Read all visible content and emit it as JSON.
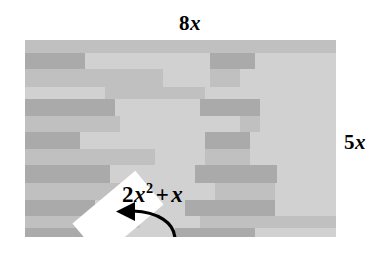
{
  "figure": {
    "type": "geometry-diagram",
    "top_label": "8x",
    "top_label_coefficient": "8",
    "top_label_variable": "x",
    "right_label": "5x",
    "right_label_coefficient": "5",
    "right_label_variable": "x",
    "region_label": {
      "coefficient": "2",
      "variable": "x",
      "exponent": "2",
      "operator": "+",
      "second_term": "x",
      "full_text": "2x² + x"
    },
    "arrow": {
      "name": "curved-arrow",
      "direction": "left",
      "points_to": "white-rotated-rectangle"
    },
    "colors": {
      "background": "#ffffff",
      "fill_light": "#cfcfcf",
      "fill_mid": "#bdbdbd",
      "fill_dark": "#a6a6a6",
      "fill_darker": "#9b9b9b",
      "cutout": "#ffffff",
      "ink": "#000000"
    },
    "rect_bounds": {
      "x": 25,
      "y": 40,
      "width": 311,
      "height": 197
    },
    "cut_piece": {
      "x": 52,
      "y": 152,
      "width": 82,
      "height": 44,
      "rotation_deg": -40
    },
    "brick_rows": [
      {
        "y": 0,
        "h": 13,
        "tone": "fill_mid",
        "blocks": []
      },
      {
        "y": 13,
        "h": 16,
        "tone": "fill_light",
        "blocks": [
          {
            "x": 0,
            "w": 60,
            "tone": "fill_dark"
          },
          {
            "x": 185,
            "w": 45,
            "tone": "fill_dark"
          }
        ]
      },
      {
        "y": 29,
        "h": 18,
        "tone": "fill_mid",
        "blocks": [
          {
            "x": 138,
            "w": 47,
            "tone": "fill_light"
          },
          {
            "x": 215,
            "w": 96,
            "tone": "fill_light"
          }
        ]
      },
      {
        "y": 47,
        "h": 12,
        "tone": "fill_light",
        "blocks": [
          {
            "x": 80,
            "w": 100,
            "tone": "fill_mid"
          }
        ]
      },
      {
        "y": 59,
        "h": 17,
        "tone": "fill_light",
        "blocks": [
          {
            "x": 0,
            "w": 90,
            "tone": "fill_dark"
          },
          {
            "x": 175,
            "w": 60,
            "tone": "fill_dark"
          }
        ]
      },
      {
        "y": 76,
        "h": 16,
        "tone": "fill_mid",
        "blocks": [
          {
            "x": 95,
            "w": 120,
            "tone": "fill_light"
          },
          {
            "x": 235,
            "w": 76,
            "tone": "fill_light"
          }
        ]
      },
      {
        "y": 92,
        "h": 17,
        "tone": "fill_light",
        "blocks": [
          {
            "x": 0,
            "w": 55,
            "tone": "fill_dark"
          },
          {
            "x": 180,
            "w": 45,
            "tone": "fill_dark"
          }
        ]
      },
      {
        "y": 109,
        "h": 16,
        "tone": "fill_mid",
        "blocks": [
          {
            "x": 130,
            "w": 50,
            "tone": "fill_light"
          },
          {
            "x": 225,
            "w": 86,
            "tone": "fill_light"
          }
        ]
      },
      {
        "y": 125,
        "h": 18,
        "tone": "fill_light",
        "blocks": [
          {
            "x": 0,
            "w": 85,
            "tone": "fill_dark"
          },
          {
            "x": 170,
            "w": 82,
            "tone": "fill_dark"
          }
        ]
      },
      {
        "y": 143,
        "h": 17,
        "tone": "fill_mid",
        "blocks": [
          {
            "x": 100,
            "w": 90,
            "tone": "fill_light"
          },
          {
            "x": 250,
            "w": 61,
            "tone": "fill_light"
          }
        ]
      },
      {
        "y": 160,
        "h": 16,
        "tone": "fill_light",
        "blocks": [
          {
            "x": 0,
            "w": 70,
            "tone": "fill_dark"
          },
          {
            "x": 160,
            "w": 90,
            "tone": "fill_dark"
          }
        ]
      },
      {
        "y": 176,
        "h": 12,
        "tone": "fill_mid",
        "blocks": [
          {
            "x": 115,
            "w": 60,
            "tone": "fill_light"
          }
        ]
      },
      {
        "y": 188,
        "h": 9,
        "tone": "fill_light",
        "blocks": [
          {
            "x": 0,
            "w": 60,
            "tone": "fill_dark"
          },
          {
            "x": 150,
            "w": 80,
            "tone": "fill_dark"
          }
        ]
      }
    ]
  }
}
